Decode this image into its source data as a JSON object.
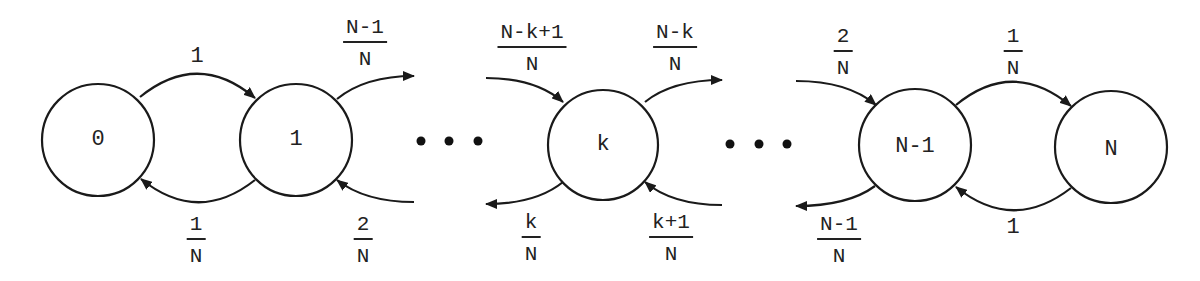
{
  "diagram": {
    "type": "birth-death markov chain",
    "states": [
      {
        "id": "s0",
        "label": "0"
      },
      {
        "id": "s1",
        "label": "1"
      },
      {
        "id": "sk",
        "label": "k"
      },
      {
        "id": "sN1",
        "label": "N-1"
      },
      {
        "id": "sN",
        "label": "N"
      }
    ],
    "ellipsis": "• • •",
    "transitions": [
      {
        "from": "0",
        "to": "1",
        "rate_plain": "1"
      },
      {
        "from": "1",
        "to": "0",
        "num": "1",
        "den": "N"
      },
      {
        "from": "1",
        "to": "2",
        "num": "N-1",
        "den": "N"
      },
      {
        "from": "2",
        "to": "1",
        "num": "2",
        "den": "N"
      },
      {
        "from": "k-1",
        "to": "k",
        "num": "N-k+1",
        "den": "N"
      },
      {
        "from": "k",
        "to": "k+1",
        "num": "N-k",
        "den": "N"
      },
      {
        "from": "k",
        "to": "k-1",
        "num": "k",
        "den": "N"
      },
      {
        "from": "k+1",
        "to": "k",
        "num": "k+1",
        "den": "N"
      },
      {
        "from": "N-2",
        "to": "N-1",
        "num": "2",
        "den": "N"
      },
      {
        "from": "N-1",
        "to": "N",
        "num": "1",
        "den": "N"
      },
      {
        "from": "N-1",
        "to": "N-2",
        "num": "N-1",
        "den": "N"
      },
      {
        "from": "N",
        "to": "N-1",
        "rate_plain": "1"
      }
    ],
    "colors": {
      "stroke": "#1a1a1a",
      "text": "#222222",
      "background": "#ffffff"
    }
  }
}
